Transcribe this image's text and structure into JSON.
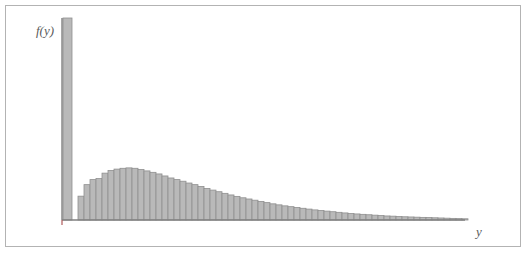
{
  "figure": {
    "background_color": "#ffffff",
    "frame_color": "#b3b3b3",
    "frame": {
      "x": 5,
      "y": 5,
      "width": 516,
      "height": 242
    }
  },
  "labels": {
    "ylabel": "f(y)",
    "xlabel": "y"
  },
  "style": {
    "bar_fill": "#b9b9b9",
    "bar_stroke": "#8f8f8f",
    "axis_color": "#808080",
    "axis_width": 1.4
  },
  "axes": {
    "origin_x": 62,
    "baseline_y": 220,
    "y_axis_top": 18,
    "x_axis_right": 465,
    "origin_tick": {
      "x": 62,
      "y_from": 220,
      "y_to": 225
    }
  },
  "chart_data": {
    "type": "bar",
    "title": "",
    "subtitle": "",
    "xlabel": "y",
    "ylabel": "f(y)",
    "grid": false,
    "legend": false,
    "legend_position": "none",
    "axis_tick_labels": {
      "x": [],
      "y": []
    },
    "xlim": [
      0,
      67
    ],
    "ylim": [
      0,
      1
    ],
    "bar_width_px": 6.0,
    "spike": {
      "label": "boundary-spike",
      "x_px": 63,
      "width_px": 9,
      "height_frac": 1.0
    },
    "categories": [
      1,
      2,
      3,
      4,
      5,
      6,
      7,
      8,
      9,
      10,
      11,
      12,
      13,
      14,
      15,
      16,
      17,
      18,
      19,
      20,
      21,
      22,
      23,
      24,
      25,
      26,
      27,
      28,
      29,
      30,
      31,
      32,
      33,
      34,
      35,
      36,
      37,
      38,
      39,
      40,
      41,
      42,
      43,
      44,
      45,
      46,
      47,
      48,
      49,
      50,
      51,
      52,
      53,
      54,
      55,
      56,
      57,
      58,
      59,
      60,
      61,
      62,
      63,
      64,
      65
    ],
    "values": [
      0.118,
      0.175,
      0.2,
      0.205,
      0.232,
      0.245,
      0.252,
      0.256,
      0.258,
      0.256,
      0.25,
      0.243,
      0.236,
      0.228,
      0.218,
      0.208,
      0.2,
      0.192,
      0.183,
      0.175,
      0.166,
      0.156,
      0.148,
      0.14,
      0.132,
      0.124,
      0.117,
      0.11,
      0.104,
      0.098,
      0.092,
      0.086,
      0.08,
      0.075,
      0.07,
      0.066,
      0.062,
      0.058,
      0.054,
      0.05,
      0.047,
      0.044,
      0.041,
      0.038,
      0.035,
      0.032,
      0.03,
      0.028,
      0.026,
      0.024,
      0.022,
      0.02,
      0.019,
      0.017,
      0.016,
      0.015,
      0.014,
      0.013,
      0.012,
      0.011,
      0.01,
      0.009,
      0.008,
      0.007,
      0.006
    ]
  }
}
